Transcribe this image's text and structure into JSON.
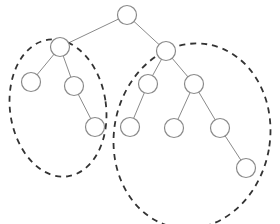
{
  "diagram": {
    "type": "binary-tree",
    "colors": {
      "background": "#ffffff",
      "node_stroke": "#8a8a8a",
      "node_fill": "#ffffff",
      "edge": "#8a8a8a",
      "subtree_outline": "#333333"
    },
    "node_radius": 9.5,
    "nodes": [
      {
        "id": "root",
        "x": 127,
        "y": 15
      },
      {
        "id": "l",
        "x": 60,
        "y": 47
      },
      {
        "id": "r",
        "x": 166,
        "y": 51
      },
      {
        "id": "ll",
        "x": 31,
        "y": 82
      },
      {
        "id": "lr",
        "x": 74,
        "y": 86
      },
      {
        "id": "lrr",
        "x": 95,
        "y": 127
      },
      {
        "id": "rl",
        "x": 148,
        "y": 84
      },
      {
        "id": "rr",
        "x": 194,
        "y": 84
      },
      {
        "id": "rll",
        "x": 130,
        "y": 127
      },
      {
        "id": "rrl",
        "x": 174,
        "y": 128
      },
      {
        "id": "rrr",
        "x": 220,
        "y": 128
      },
      {
        "id": "rrrr",
        "x": 246,
        "y": 168
      }
    ],
    "edges": [
      [
        "root",
        "l"
      ],
      [
        "root",
        "r"
      ],
      [
        "l",
        "ll"
      ],
      [
        "l",
        "lr"
      ],
      [
        "lr",
        "lrr"
      ],
      [
        "r",
        "rl"
      ],
      [
        "r",
        "rr"
      ],
      [
        "rl",
        "rll"
      ],
      [
        "rr",
        "rrl"
      ],
      [
        "rr",
        "rrr"
      ],
      [
        "rrr",
        "rrrr"
      ]
    ],
    "subtree_groups": [
      {
        "id": "left-subtree",
        "cx": 58,
        "cy": 108,
        "rx": 48,
        "ry": 69,
        "rotate": -8
      },
      {
        "id": "right-subtree",
        "cx": 192,
        "cy": 136,
        "rx": 78,
        "ry": 93,
        "rotate": 10
      }
    ]
  }
}
